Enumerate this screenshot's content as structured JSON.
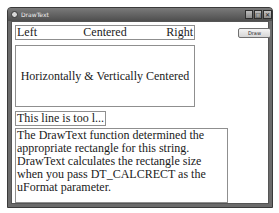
{
  "window": {
    "title": "DrawText",
    "controls": {
      "minimize": "_",
      "maximize": "□",
      "close": "✕"
    }
  },
  "toolbar": {
    "draw_label": "Draw"
  },
  "content": {
    "row": {
      "left": "Left",
      "center": "Centered",
      "right": "Right"
    },
    "centered_box": "Horizontally & Vertically Centered",
    "ellipsis_box": "This line is too l...",
    "paragraph_box": "The DrawText function determined the appropriate rectangle for this string. DrawText calculates the rectangle size when you pass DT_CALCRECT as the uFormat parameter."
  }
}
